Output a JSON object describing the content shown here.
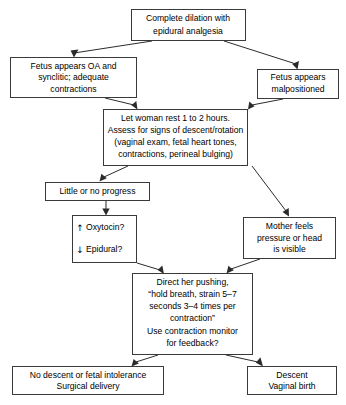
{
  "diagram": {
    "type": "flowchart",
    "background_color": "#ffffff",
    "box_stroke_color": "#3a3a3a",
    "arrow_color": "#2b2b2b",
    "nodes": [
      {
        "id": "complete-dilation",
        "name": "complete-dilation-node",
        "lines": [
          "Complete dilation with",
          "epidural analgesia"
        ]
      },
      {
        "id": "fetus-oa",
        "name": "fetus-oa-synclitic-node",
        "lines": [
          "Fetus appears OA and",
          "synclitic; adequate",
          "contractions"
        ]
      },
      {
        "id": "fetus-malpositioned",
        "name": "fetus-malpositioned-node",
        "lines": [
          "Fetus appears",
          "malpositioned"
        ]
      },
      {
        "id": "let-woman-rest",
        "name": "let-woman-rest-node",
        "lines": [
          "Let woman rest 1 to 2 hours.",
          "Assess for signs of descent/rotation",
          "(vaginal exam, fetal heart tones,",
          "contractions, perineal bulging)"
        ]
      },
      {
        "id": "little-progress",
        "name": "little-or-no-progress-node",
        "lines": [
          "Little or no progress"
        ]
      },
      {
        "id": "oxytocin-epidural",
        "name": "oxytocin-epidural-node",
        "rows": [
          {
            "arrow": "↑",
            "arrow_name": "up-arrow-icon",
            "label": "Oxytocin?"
          },
          {
            "arrow": "↓",
            "arrow_name": "down-arrow-icon",
            "label": "Epidural?"
          }
        ]
      },
      {
        "id": "mother-feels",
        "name": "mother-feels-pressure-node",
        "lines": [
          "Mother feels",
          "pressure or head",
          "is visible"
        ]
      },
      {
        "id": "direct-pushing",
        "name": "direct-her-pushing-node",
        "lines": [
          "Direct her pushing,",
          "“hold breath, strain 5–7",
          "seconds 3–4 times per",
          "contraction”",
          "Use contraction monitor",
          "for feedback?"
        ]
      },
      {
        "id": "no-descent",
        "name": "no-descent-surgical-delivery-node",
        "lines": [
          "No descent or fetal intolerance",
          "Surgical delivery"
        ]
      },
      {
        "id": "descent",
        "name": "descent-vaginal-birth-node",
        "lines": [
          "Descent",
          "Vaginal birth"
        ]
      }
    ],
    "edges": [
      {
        "name": "edge-complete-dilation-to-fetus-oa",
        "from": "complete-dilation",
        "to": "fetus-oa"
      },
      {
        "name": "edge-complete-dilation-to-fetus-malpositioned",
        "from": "complete-dilation",
        "to": "fetus-malpositioned"
      },
      {
        "name": "edge-fetus-oa-to-let-woman-rest",
        "from": "fetus-oa",
        "to": "let-woman-rest"
      },
      {
        "name": "edge-fetus-malpositioned-to-let-woman-rest",
        "from": "fetus-malpositioned",
        "to": "let-woman-rest"
      },
      {
        "name": "edge-let-woman-rest-to-little-progress",
        "from": "let-woman-rest",
        "to": "little-progress"
      },
      {
        "name": "edge-let-woman-rest-to-mother-feels",
        "from": "let-woman-rest",
        "to": "mother-feels"
      },
      {
        "name": "edge-little-progress-to-oxytocin-epidural",
        "from": "little-progress",
        "to": "oxytocin-epidural"
      },
      {
        "name": "edge-oxytocin-epidural-to-direct-pushing",
        "from": "oxytocin-epidural",
        "to": "direct-pushing"
      },
      {
        "name": "edge-mother-feels-to-direct-pushing",
        "from": "mother-feels",
        "to": "direct-pushing"
      },
      {
        "name": "edge-direct-pushing-to-no-descent",
        "from": "direct-pushing",
        "to": "no-descent"
      },
      {
        "name": "edge-direct-pushing-to-descent",
        "from": "direct-pushing",
        "to": "descent"
      }
    ]
  }
}
